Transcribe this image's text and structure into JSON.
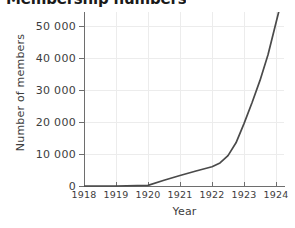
{
  "chart_data": {
    "type": "line",
    "title": "Membership numbers",
    "xlabel": "Year",
    "ylabel": "Number of members",
    "xlim": [
      1918,
      1924.5
    ],
    "ylim": [
      0,
      55000
    ],
    "grid": true,
    "legend": "none",
    "xticks": [
      1918,
      1919,
      1920,
      1921,
      1922,
      1923,
      1924
    ],
    "xtick_labels": [
      "1918",
      "1919",
      "1920",
      "1921",
      "1922",
      "1923",
      "1924"
    ],
    "yticks": [
      0,
      10000,
      20000,
      30000,
      40000,
      50000
    ],
    "ytick_labels": [
      "0",
      "10 000",
      "20 000",
      "30 000",
      "40 000",
      "50 000"
    ],
    "series": [
      {
        "name": "Members",
        "color": "#4a4a4a",
        "x": [
          1918,
          1919,
          1920,
          1920.5,
          1921,
          1921.5,
          1922,
          1922.25,
          1922.5,
          1922.75,
          1923,
          1923.25,
          1923.5,
          1923.75,
          1924,
          1924.1
        ],
        "values": [
          0,
          0,
          200,
          1800,
          3300,
          4700,
          6000,
          7200,
          9500,
          13500,
          19500,
          26000,
          33000,
          41000,
          51000,
          55000
        ]
      }
    ],
    "annotations": []
  },
  "axis_colors": {
    "axis": "#6e6e6e",
    "grid": "#ececec",
    "text": "#3d3d3d",
    "line": "#4a4a4a",
    "background": "#ffffff"
  }
}
